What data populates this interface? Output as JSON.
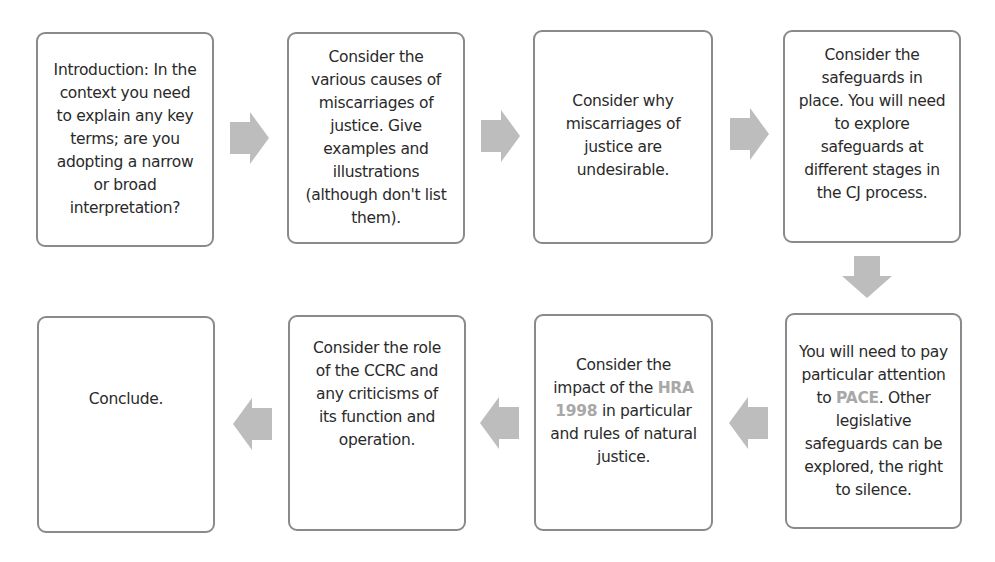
{
  "diagram": {
    "type": "flowchart",
    "arrow_color": "#bdbdbd",
    "border_color": "#8a8a8a",
    "highlight_color": "#a8a8a8",
    "steps": [
      {
        "id": 1,
        "text": "Introduction: In the context you need to explain any key terms; are you adopting a narrow or broad interpretation?"
      },
      {
        "id": 2,
        "text": "Consider the various causes of miscarriages of justice. Give examples and illustrations (although don't list them)."
      },
      {
        "id": 3,
        "text": "Consider why miscarriages of justice are undesirable."
      },
      {
        "id": 4,
        "text": "Consider the safeguards in place. You will need to explore safeguards at different stages in the CJ process."
      },
      {
        "id": 5,
        "text_before": "You will need to pay particular attention to ",
        "highlight": "PACE",
        "text_after": ". Other legislative safeguards can be explored, the right to silence."
      },
      {
        "id": 6,
        "text_before": "Consider the impact of the ",
        "highlight": "HRA 1998",
        "text_after": " in particular and rules of natural justice."
      },
      {
        "id": 7,
        "text": "Consider the role of the CCRC and any criticisms of its function and operation."
      },
      {
        "id": 8,
        "text": "Conclude."
      }
    ],
    "flow": [
      "1→2",
      "2→3",
      "3→4",
      "4↓5",
      "5←6 (right to left)",
      "6→7 leftward",
      "7→8 leftward"
    ]
  }
}
